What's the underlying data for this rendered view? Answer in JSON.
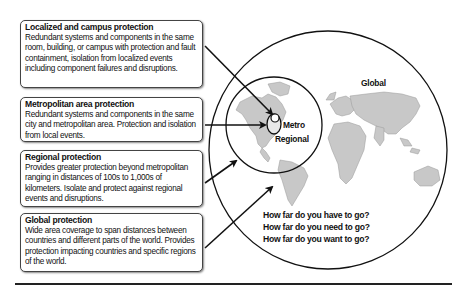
{
  "boxes": [
    {
      "title": "Localized and campus protection",
      "description": "Redundant systems and components in the same room, building, or campus with protection and fault containment, isolation from localized events including component failures and disruptions."
    },
    {
      "title": "Metropolitan area protection",
      "description": "Redundant systems and components in the same city and metropolitan area. Protection and isolation from local events."
    },
    {
      "title": "Regional protection",
      "description": "Provides greater protection beyond metropolitan ranging in distances of 100s to 1,000s of kilometers. Isolate and protect against regional events and disruptions."
    },
    {
      "title": "Global protection",
      "description": "Wide area coverage to span distances between countries and different parts of the world. Provides protection impacting countries and specific regions of the world."
    }
  ],
  "circles": {
    "global_label": "Global",
    "regional_label": "Regional",
    "metro_label": "Metro"
  },
  "questions": [
    "How far do you have to go?",
    "How far do you need to go?",
    "How far do you want to go?"
  ],
  "colors": {
    "map_fill": "#c8c8c8",
    "line": "#111111",
    "box_border": "#444444"
  }
}
